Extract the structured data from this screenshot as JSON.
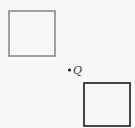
{
  "diagram": {
    "shapes": [
      {
        "type": "square",
        "name": "gray-square",
        "x": 9,
        "y": 11,
        "w": 46,
        "h": 45,
        "stroke": "#8a8a8a"
      },
      {
        "type": "square",
        "name": "black-square",
        "x": 84,
        "y": 83,
        "w": 46,
        "h": 43,
        "stroke": "#1a1a1a"
      }
    ],
    "point": {
      "label": "Q",
      "x": 69,
      "y": 70
    }
  }
}
